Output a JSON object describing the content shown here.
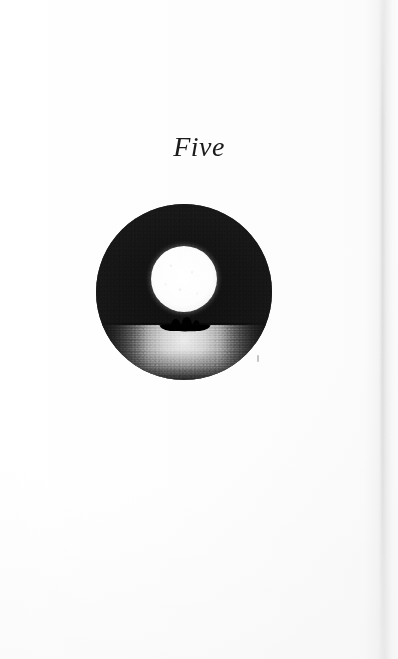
{
  "page": {
    "background_color": "#ffffff",
    "width": 398,
    "height": 659
  },
  "chapter": {
    "title": "Five",
    "style": "italic-serif",
    "ink_color": "#1b1b1b"
  },
  "illustration": {
    "name": "moonrise-over-water-with-boat",
    "shape": "circle",
    "center_x": 184,
    "center_y": 292,
    "radius": 88,
    "colors": {
      "sky": "#1a1a1a",
      "moon": "#ffffff",
      "water_highlight": "#f2f2f2",
      "water_shadow": "#1e1e1e",
      "silhouette": "#000000"
    },
    "elements": {
      "sky_label": "night sky",
      "moon_label": "full moon",
      "horizon_label": "horizon line",
      "water_label": "moonlit water reflection",
      "boat_label": "rowboat with two figures"
    }
  },
  "artifacts": {
    "scan_speck_label": "scan speck",
    "page_edge_label": "scanned page edge"
  }
}
